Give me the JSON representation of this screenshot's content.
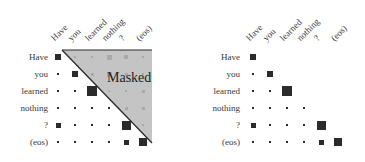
{
  "tokens": [
    "Have",
    "you",
    "learned",
    "nothing",
    "?",
    "(eos)"
  ],
  "left_panel": {
    "masked_label": "Masked",
    "triangle_color": "#c4c4c4",
    "triangle_edge_color": "#2a2a2a"
  },
  "right_panel": {},
  "chart_data": [
    {
      "type": "heatmap",
      "title": "Self-attention with causal mask (masked region shown)",
      "x_labels": [
        "Have",
        "you",
        "learned",
        "nothing",
        "?",
        "(eos)"
      ],
      "y_labels": [
        "Have",
        "you",
        "learned",
        "nothing",
        "?",
        "(eos)"
      ],
      "annotation": "Masked",
      "cell_sizes": [
        [
          6,
          2,
          2,
          5,
          4,
          2
        ],
        [
          2,
          6,
          3,
          5,
          3,
          2
        ],
        [
          2,
          2,
          10,
          2,
          2,
          3
        ],
        [
          2,
          2,
          2,
          2,
          3,
          3
        ],
        [
          5,
          2,
          2,
          2,
          9,
          2
        ],
        [
          2,
          2,
          2,
          2,
          5,
          8
        ]
      ],
      "masked": "upper triangle (j > i)"
    },
    {
      "type": "heatmap",
      "title": "Self-attention after masking",
      "x_labels": [
        "Have",
        "you",
        "learned",
        "nothing",
        "?",
        "(eos)"
      ],
      "y_labels": [
        "Have",
        "you",
        "learned",
        "nothing",
        "?",
        "(eos)"
      ],
      "cell_sizes": [
        [
          6,
          0,
          0,
          0,
          0,
          0
        ],
        [
          2,
          6,
          0,
          0,
          0,
          0
        ],
        [
          2,
          2,
          10,
          0,
          0,
          0
        ],
        [
          2,
          2,
          2,
          2,
          0,
          0
        ],
        [
          5,
          2,
          2,
          2,
          9,
          0
        ],
        [
          2,
          2,
          2,
          2,
          5,
          8
        ]
      ]
    }
  ]
}
